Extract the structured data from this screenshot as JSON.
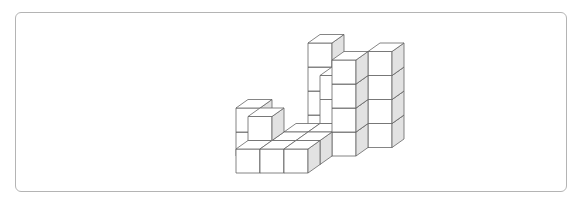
{
  "figure": {
    "colors": {
      "front": "#ffffff",
      "top": "#ffffff",
      "side": "#e2e2e2",
      "stroke": "#666666",
      "frame": "#b4b4b4"
    },
    "projection": {
      "origin": [
        236,
        173
      ],
      "unit_x": [
        24,
        0
      ],
      "unit_z": [
        12,
        -8.5
      ],
      "unit_y": [
        0,
        -24
      ]
    },
    "cubes": [
      {
        "x": 1,
        "z": 4,
        "y": 0
      },
      {
        "x": 1,
        "z": 4,
        "y": 1
      },
      {
        "x": 1,
        "z": 4,
        "y": 2
      },
      {
        "x": 1,
        "z": 4,
        "y": 3
      },
      {
        "x": 3,
        "z": 3,
        "y": 0
      },
      {
        "x": 3,
        "z": 3,
        "y": 1
      },
      {
        "x": 3,
        "z": 3,
        "y": 2
      },
      {
        "x": 4,
        "z": 3,
        "y": 0
      },
      {
        "x": 4,
        "z": 3,
        "y": 1
      },
      {
        "x": 4,
        "z": 3,
        "y": 2
      },
      {
        "x": 4,
        "z": 3,
        "y": 3
      },
      {
        "x": 2,
        "z": 3,
        "y": 0
      },
      {
        "x": 2,
        "z": 3,
        "y": 1
      },
      {
        "x": 2,
        "z": 3,
        "y": 2
      },
      {
        "x": -1,
        "z": 2,
        "y": 0
      },
      {
        "x": -1,
        "z": 2,
        "y": 1
      },
      {
        "x": 3,
        "z": 2,
        "y": 0
      },
      {
        "x": 3,
        "z": 2,
        "y": 1
      },
      {
        "x": 3,
        "z": 2,
        "y": 2
      },
      {
        "x": 3,
        "z": 2,
        "y": 3
      },
      {
        "x": 1,
        "z": 2,
        "y": 0
      },
      {
        "x": 0,
        "z": 1,
        "y": 0
      },
      {
        "x": 0,
        "z": 1,
        "y": 1
      },
      {
        "x": 2,
        "z": 1,
        "y": 0
      },
      {
        "x": 1,
        "z": 1,
        "y": 0
      },
      {
        "x": 2,
        "z": 2,
        "y": 0
      },
      {
        "x": 0,
        "z": 0,
        "y": 0
      },
      {
        "x": 1,
        "z": 0,
        "y": 0
      },
      {
        "x": 2,
        "z": 0,
        "y": 0
      }
    ]
  }
}
